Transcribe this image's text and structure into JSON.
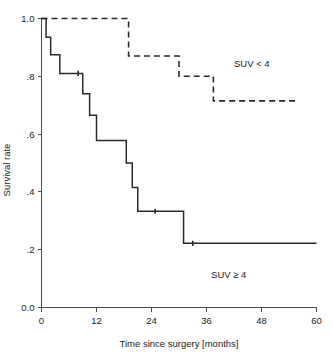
{
  "chart_data": {
    "type": "line",
    "title": "",
    "xlabel": "Time since surgery [months]",
    "ylabel": "Survival rate",
    "xlim": [
      0,
      60
    ],
    "ylim": [
      0.0,
      1.0
    ],
    "xticks": [
      0,
      12,
      24,
      36,
      48,
      60
    ],
    "xticklabels": [
      "0",
      "12",
      "24",
      "36",
      "48",
      "60"
    ],
    "yticks": [
      0.0,
      0.2,
      0.4,
      0.6,
      0.8,
      1.0
    ],
    "yticklabels": [
      "0.0",
      ".2",
      ".4",
      ".6",
      ".8",
      "1.0"
    ],
    "grid": false,
    "legend_position": "inline-annotation",
    "series": [
      {
        "name": "SUV < 4",
        "style": "dashed",
        "label_x": 42.0,
        "label_y": 0.845,
        "steps": [
          {
            "x": 0.0,
            "y": 1.0
          },
          {
            "x": 19.0,
            "y": 1.0
          },
          {
            "x": 19.0,
            "y": 0.87
          },
          {
            "x": 30.0,
            "y": 0.87
          },
          {
            "x": 30.0,
            "y": 0.8
          },
          {
            "x": 37.5,
            "y": 0.8
          },
          {
            "x": 37.5,
            "y": 0.715
          },
          {
            "x": 56.0,
            "y": 0.715
          }
        ]
      },
      {
        "name": "SUV ≥ 4",
        "style": "solid",
        "label_x": 37.0,
        "label_y": 0.115,
        "steps": [
          {
            "x": 0.0,
            "y": 1.0
          },
          {
            "x": 1.0,
            "y": 1.0
          },
          {
            "x": 1.0,
            "y": 0.935
          },
          {
            "x": 2.0,
            "y": 0.935
          },
          {
            "x": 2.0,
            "y": 0.875
          },
          {
            "x": 4.0,
            "y": 0.875
          },
          {
            "x": 4.0,
            "y": 0.81
          },
          {
            "x": 9.0,
            "y": 0.81
          },
          {
            "x": 9.0,
            "y": 0.74
          },
          {
            "x": 10.5,
            "y": 0.74
          },
          {
            "x": 10.5,
            "y": 0.665
          },
          {
            "x": 12.0,
            "y": 0.665
          },
          {
            "x": 12.0,
            "y": 0.578
          },
          {
            "x": 18.5,
            "y": 0.578
          },
          {
            "x": 18.5,
            "y": 0.5
          },
          {
            "x": 19.8,
            "y": 0.5
          },
          {
            "x": 19.8,
            "y": 0.415
          },
          {
            "x": 21.0,
            "y": 0.415
          },
          {
            "x": 21.0,
            "y": 0.333
          },
          {
            "x": 31.0,
            "y": 0.333
          },
          {
            "x": 31.0,
            "y": 0.222
          },
          {
            "x": 60.0,
            "y": 0.222
          }
        ],
        "censored": [
          {
            "x": 8.0,
            "y": 0.81
          },
          {
            "x": 24.8,
            "y": 0.333
          },
          {
            "x": 33.0,
            "y": 0.222
          }
        ]
      }
    ]
  }
}
